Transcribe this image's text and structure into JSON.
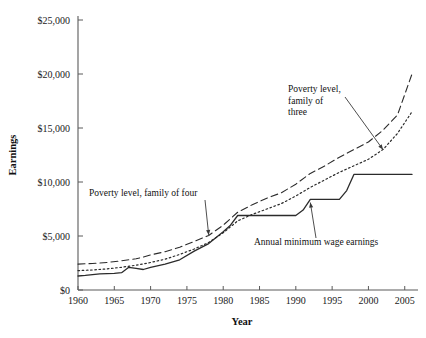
{
  "chart_data": {
    "type": "line",
    "title": "",
    "xlabel": "Year",
    "ylabel": "Earnings",
    "xlim": [
      1960,
      2006
    ],
    "ylim": [
      0,
      25000
    ],
    "grid": false,
    "legend_position": "inline-annotations",
    "x_ticks": [
      "1960",
      "1965",
      "1970",
      "1975",
      "1980",
      "1985",
      "1990",
      "1995",
      "2000",
      "2005"
    ],
    "x_tick_values": [
      1960,
      1965,
      1970,
      1975,
      1980,
      1985,
      1990,
      1995,
      2000,
      2005
    ],
    "y_ticks": [
      "$0",
      "$5,000",
      "$10,000",
      "$15,000",
      "$20,000",
      "$25,000"
    ],
    "y_tick_values": [
      0,
      5000,
      10000,
      15000,
      20000,
      25000
    ],
    "series": [
      {
        "name": "Poverty level, family of four",
        "style": "long-dashed",
        "x": [
          1960,
          1962,
          1964,
          1966,
          1967,
          1968,
          1969,
          1970,
          1972,
          1974,
          1976,
          1978,
          1980,
          1982,
          1984,
          1986,
          1988,
          1990,
          1992,
          1994,
          1996,
          1998,
          2000,
          2002,
          2004,
          2006
        ],
        "values": [
          2400,
          2450,
          2550,
          2700,
          2800,
          2900,
          3050,
          3250,
          3550,
          3950,
          4500,
          5050,
          6000,
          7200,
          7900,
          8500,
          9000,
          9800,
          10800,
          11500,
          12300,
          13000,
          13700,
          14800,
          16200,
          20000
        ]
      },
      {
        "name": "Poverty level, family of three",
        "style": "dotted",
        "x": [
          1960,
          1962,
          1964,
          1966,
          1968,
          1970,
          1972,
          1974,
          1976,
          1978,
          1980,
          1982,
          1984,
          1986,
          1988,
          1990,
          1992,
          1994,
          1996,
          1998,
          2000,
          2002,
          2004,
          2006
        ],
        "values": [
          1800,
          1850,
          1950,
          2100,
          2300,
          2550,
          2850,
          3300,
          3800,
          4400,
          5300,
          6400,
          7000,
          7500,
          8000,
          8700,
          9500,
          10200,
          10900,
          11500,
          12100,
          13000,
          14500,
          16500
        ]
      },
      {
        "name": "Annual minimum wage earnings",
        "style": "solid-step",
        "x": [
          1960,
          1961,
          1963,
          1965,
          1966,
          1967,
          1968,
          1969,
          1970,
          1972,
          1974,
          1976,
          1978,
          1980,
          1981,
          1982,
          1990,
          1991,
          1992,
          1996,
          1997,
          1998,
          2006
        ],
        "values": [
          1300,
          1350,
          1500,
          1550,
          1600,
          2100,
          2000,
          1900,
          2100,
          2400,
          2800,
          3600,
          4300,
          5400,
          6000,
          6900,
          6900,
          7400,
          8400,
          8400,
          9200,
          10700,
          10700
        ]
      }
    ],
    "annotations": [
      {
        "name": "poverty-four-annotation",
        "lines": [
          "Poverty level, family of four"
        ],
        "target_year": 1978,
        "target_value": 5100
      },
      {
        "name": "poverty-three-annotation",
        "lines": [
          "Poverty level,",
          "family of",
          "three"
        ],
        "target_year": 2002,
        "target_value": 13000
      },
      {
        "name": "minimum-wage-annotation",
        "lines": [
          "Annual minimum wage earnings"
        ],
        "target_year": 1992,
        "target_value": 8100
      }
    ],
    "colors": {
      "line": "#2b2b2b",
      "axis": "#5a5a5a",
      "text": "#111111",
      "background": "#ffffff"
    }
  }
}
